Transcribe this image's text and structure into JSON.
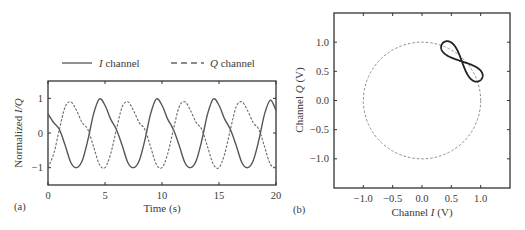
{
  "chart_data": [
    {
      "panel": "(a)",
      "type": "line",
      "title": "",
      "xlabel": "Time (s)",
      "ylabel_prefix": "Normalized ",
      "ylabel_italic": "I/Q",
      "xlim": [
        0,
        20
      ],
      "ylim": [
        -1.5,
        1.5
      ],
      "xticks": [
        0,
        5,
        10,
        15,
        20
      ],
      "xtick_labels": [
        "0",
        "5",
        "10",
        "15",
        "20"
      ],
      "yticks": [
        -1,
        0,
        1
      ],
      "ytick_labels": [
        "−1",
        "0",
        "1"
      ],
      "grid": false,
      "legend": {
        "placement": "top-outside",
        "entries": [
          {
            "italic": "I",
            "text": " channel",
            "style": "solid"
          },
          {
            "italic": "Q",
            "text": " channel",
            "style": "dashed"
          }
        ]
      },
      "series": [
        {
          "name": "I channel",
          "style": "solid",
          "color": "#555555",
          "x": [
            0,
            0.5,
            1,
            1.5,
            2,
            2.5,
            3,
            3.5,
            4,
            4.5,
            5,
            5.5,
            6,
            6.5,
            7,
            7.5,
            8,
            8.5,
            9,
            9.5,
            10,
            10.5,
            11,
            11.5,
            12,
            12.5,
            13,
            13.5,
            14,
            14.5,
            15,
            15.5,
            16,
            16.5,
            17,
            17.5,
            18,
            18.5,
            19,
            19.5,
            20
          ],
          "y": [
            0.55,
            0.3,
            0.1,
            -0.35,
            -0.85,
            -1.0,
            -0.8,
            -0.2,
            0.55,
            0.98,
            0.8,
            0.4,
            0.1,
            -0.35,
            -0.85,
            -1.0,
            -0.8,
            -0.2,
            0.55,
            0.98,
            0.8,
            0.4,
            0.1,
            -0.35,
            -0.85,
            -1.0,
            -0.8,
            -0.2,
            0.55,
            0.98,
            0.8,
            0.4,
            0.1,
            -0.35,
            -0.85,
            -1.0,
            -0.8,
            -0.2,
            0.55,
            0.95,
            0.65
          ]
        },
        {
          "name": "Q channel",
          "style": "dashed",
          "color": "#6a6a6a",
          "x": [
            0,
            0.5,
            1,
            1.5,
            2,
            2.5,
            3,
            3.5,
            4,
            4.5,
            5,
            5.5,
            6,
            6.5,
            7,
            7.5,
            8,
            8.5,
            9,
            9.5,
            10,
            10.5,
            11,
            11.5,
            12,
            12.5,
            13,
            13.5,
            14,
            14.5,
            15,
            15.5,
            16,
            16.5,
            17,
            17.5,
            18,
            18.5,
            19,
            19.5,
            20
          ],
          "y": [
            -1.0,
            -0.6,
            0.1,
            0.75,
            0.9,
            0.65,
            0.3,
            0.1,
            -0.4,
            -0.9,
            -1.0,
            -0.6,
            0.1,
            0.75,
            0.9,
            0.65,
            0.3,
            0.1,
            -0.4,
            -0.9,
            -1.0,
            -0.6,
            0.1,
            0.75,
            0.9,
            0.65,
            0.3,
            0.1,
            -0.4,
            -0.9,
            -1.0,
            -0.6,
            0.1,
            0.75,
            0.9,
            0.65,
            0.3,
            0.1,
            -0.4,
            -0.9,
            -1.0
          ]
        }
      ]
    },
    {
      "panel": "(b)",
      "type": "line",
      "title": "",
      "xlabel_prefix": "Channel ",
      "xlabel_italic": "I",
      "xlabel_suffix": " (V)",
      "ylabel_prefix": "Channel ",
      "ylabel_italic": "Q",
      "ylabel_suffix": " (V)",
      "xlim": [
        -1.5,
        1.5
      ],
      "ylim": [
        -1.5,
        1.5
      ],
      "xticks": [
        -1.0,
        -0.5,
        0.0,
        0.5,
        1.0
      ],
      "xtick_labels": [
        "−1.0",
        "−0.5",
        "0.0",
        "0.5",
        "1.0"
      ],
      "yticks": [
        -1.0,
        -0.5,
        0.0,
        0.5,
        1.0
      ],
      "ytick_labels": [
        "−1.0",
        "−0.5",
        "0.0",
        "0.5",
        "1.0"
      ],
      "grid": false,
      "series": [
        {
          "name": "unit circle",
          "style": "dashed",
          "color": "#8a8a8a",
          "shape": "circle",
          "center": [
            0,
            0
          ],
          "radius": 1.0
        },
        {
          "name": "I/Q trajectory",
          "style": "solid",
          "color": "#222222",
          "shape": "figure-eight",
          "center": [
            0.68,
            0.67
          ],
          "lobe_tips": [
            [
              0.32,
              0.93
            ],
            [
              0.97,
              0.3
            ]
          ]
        }
      ]
    }
  ]
}
